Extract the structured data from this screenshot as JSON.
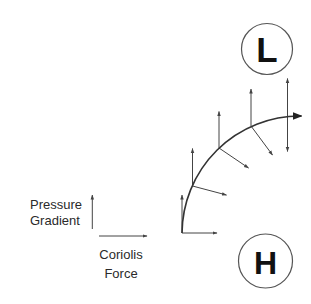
{
  "diagram": {
    "legend": {
      "pressure_gradient_line1": "Pressure",
      "pressure_gradient_line2": "Gradient",
      "coriolis_line1": "Coriolis",
      "coriolis_line2": "Force"
    },
    "centers": {
      "low": {
        "label": "L",
        "cx": 267,
        "cy": 49,
        "r": 25.5
      },
      "high": {
        "label": "H",
        "cx": 265.5,
        "cy": 261,
        "r": 27
      }
    },
    "trajectory": {
      "description": "Curved flow path bending clockwise from the H toward the right, with arrowhead",
      "start": [
        182,
        233
      ],
      "end": [
        301,
        116
      ],
      "arc_center": [
        300,
        234
      ],
      "arc_radius": 118
    },
    "force_pairs": [
      {
        "point": [
          182,
          233
        ],
        "pressure_gradient_tip": [
          182,
          195
        ],
        "coriolis_tip": [
          217,
          233
        ]
      },
      {
        "point": [
          192.5,
          186
        ],
        "pressure_gradient_tip": [
          192.5,
          148.5
        ],
        "coriolis_tip": [
          226.5,
          195
        ]
      },
      {
        "point": [
          219,
          148
        ],
        "pressure_gradient_tip": [
          219,
          111.5
        ],
        "coriolis_tip": [
          248.5,
          168
        ]
      },
      {
        "point": [
          251,
          126
        ],
        "pressure_gradient_tip": [
          251,
          89
        ],
        "coriolis_tip": [
          272.5,
          155
        ]
      },
      {
        "point": [
          287.5,
          117
        ],
        "pressure_gradient_tip": [
          287.5,
          78.5
        ],
        "coriolis_tip": [
          287.5,
          151.5
        ]
      }
    ],
    "colors": {
      "line": "#444444",
      "text": "#2a2a2a",
      "letters": "#111111",
      "background": "#ffffff"
    }
  }
}
